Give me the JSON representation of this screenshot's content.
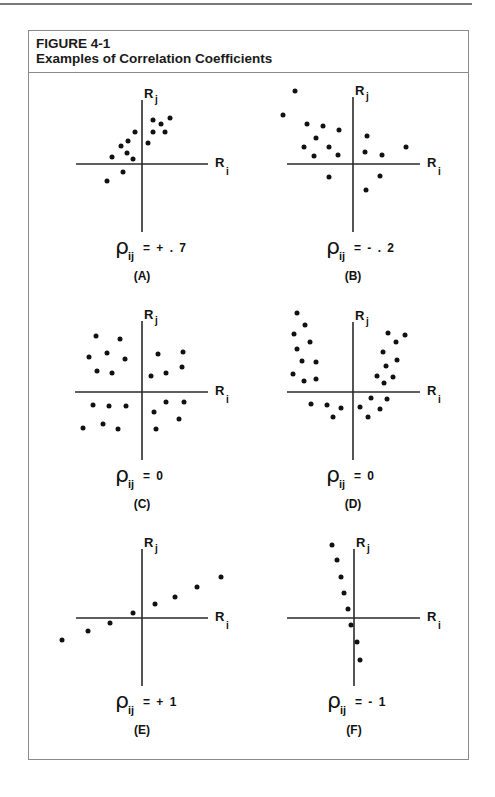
{
  "figure": {
    "number": "FIGURE 4-1",
    "title": "Examples of Correlation Coefficients"
  },
  "axis_labels": {
    "y_main": "R",
    "y_sub": "j",
    "x_main": "R",
    "x_sub": "i"
  },
  "chart_data": [
    {
      "type": "scatter",
      "panel": "(A)",
      "coefficient_label": "ρij = +.7",
      "rho_symbol": "ρ",
      "rho_sub": "ij",
      "rho_value": "= + . 7",
      "correlation": 0.7,
      "xlabel": "Ri",
      "ylabel": "Rj",
      "origin": [
        142,
        164
      ],
      "axis_extent": {
        "x": [
          76,
          208
        ],
        "y": [
          100,
          232
        ]
      },
      "points_px": [
        [
          170,
          118
        ],
        [
          153,
          120
        ],
        [
          161,
          124
        ],
        [
          135,
          132
        ],
        [
          153,
          132
        ],
        [
          165,
          132
        ],
        [
          128,
          141
        ],
        [
          148,
          143
        ],
        [
          121,
          146
        ],
        [
          127,
          153
        ],
        [
          112,
          157
        ],
        [
          133,
          159
        ],
        [
          123,
          172
        ],
        [
          107,
          181
        ]
      ]
    },
    {
      "type": "scatter",
      "panel": "(B)",
      "coefficient_label": "ρij = -.2",
      "rho_symbol": "ρ",
      "rho_sub": "ij",
      "rho_value": "= - . 2",
      "correlation": -0.2,
      "xlabel": "Ri",
      "ylabel": "Rj",
      "origin": [
        353,
        164
      ],
      "axis_extent": {
        "x": [
          287,
          420
        ],
        "y": [
          97,
          232
        ]
      },
      "points_px": [
        [
          295,
          91
        ],
        [
          283,
          115
        ],
        [
          307,
          124
        ],
        [
          323,
          126
        ],
        [
          339,
          130
        ],
        [
          316,
          138
        ],
        [
          367,
          136
        ],
        [
          304,
          147
        ],
        [
          329,
          147
        ],
        [
          406,
          147
        ],
        [
          365,
          152
        ],
        [
          338,
          155
        ],
        [
          382,
          155
        ],
        [
          314,
          156
        ],
        [
          329,
          177
        ],
        [
          380,
          176
        ],
        [
          366,
          190
        ]
      ]
    },
    {
      "type": "scatter",
      "panel": "(C)",
      "coefficient_label": "ρij = 0",
      "rho_symbol": "ρ",
      "rho_sub": "ij",
      "rho_value": "= 0",
      "correlation": 0,
      "xlabel": "Ri",
      "ylabel": "Rj",
      "origin": [
        142,
        392
      ],
      "axis_extent": {
        "x": [
          75,
          208
        ],
        "y": [
          321,
          460
        ]
      },
      "points_px": [
        [
          96,
          336
        ],
        [
          120,
          339
        ],
        [
          89,
          357
        ],
        [
          107,
          353
        ],
        [
          125,
          359
        ],
        [
          158,
          354
        ],
        [
          183,
          352
        ],
        [
          97,
          371
        ],
        [
          112,
          373
        ],
        [
          151,
          376
        ],
        [
          166,
          373
        ],
        [
          182,
          367
        ],
        [
          93,
          405
        ],
        [
          109,
          406
        ],
        [
          126,
          406
        ],
        [
          166,
          402
        ],
        [
          184,
          402
        ],
        [
          154,
          412
        ],
        [
          179,
          419
        ],
        [
          83,
          428
        ],
        [
          103,
          424
        ],
        [
          118,
          429
        ],
        [
          156,
          429
        ]
      ]
    },
    {
      "type": "scatter",
      "panel": "(D)",
      "coefficient_label": "ρij = 0",
      "rho_symbol": "ρ",
      "rho_sub": "ij",
      "rho_value": "= 0",
      "correlation": 0,
      "xlabel": "Ri",
      "ylabel": "Rj",
      "origin": [
        353,
        392
      ],
      "axis_extent": {
        "x": [
          287,
          420
        ],
        "y": [
          322,
          460
        ]
      },
      "points_px": [
        [
          297,
          313
        ],
        [
          305,
          325
        ],
        [
          294,
          334
        ],
        [
          310,
          342
        ],
        [
          297,
          349
        ],
        [
          302,
          361
        ],
        [
          316,
          362
        ],
        [
          293,
          374
        ],
        [
          304,
          381
        ],
        [
          316,
          379
        ],
        [
          388,
          333
        ],
        [
          405,
          335
        ],
        [
          396,
          342
        ],
        [
          383,
          352
        ],
        [
          397,
          360
        ],
        [
          386,
          366
        ],
        [
          377,
          376
        ],
        [
          393,
          377
        ],
        [
          384,
          383
        ],
        [
          311,
          404
        ],
        [
          327,
          405
        ],
        [
          341,
          408
        ],
        [
          333,
          417
        ],
        [
          371,
          398
        ],
        [
          387,
          399
        ],
        [
          360,
          407
        ],
        [
          380,
          409
        ],
        [
          368,
          417
        ]
      ]
    },
    {
      "type": "scatter",
      "panel": "(E)",
      "coefficient_label": "ρij = +1",
      "rho_symbol": "ρ",
      "rho_sub": "ij",
      "rho_value": "= + 1",
      "correlation": 1,
      "xlabel": "Ri",
      "ylabel": "Rj",
      "origin": [
        142,
        618
      ],
      "axis_extent": {
        "x": [
          76,
          208
        ],
        "y": [
          549,
          686
        ]
      },
      "points_px": [
        [
          62,
          640
        ],
        [
          88,
          631
        ],
        [
          110,
          623
        ],
        [
          133,
          613
        ],
        [
          155,
          604
        ],
        [
          175,
          597
        ],
        [
          197,
          587
        ],
        [
          221,
          577
        ]
      ]
    },
    {
      "type": "scatter",
      "panel": "(F)",
      "coefficient_label": "ρij = -1",
      "rho_symbol": "ρ",
      "rho_sub": "ij",
      "rho_value": "= - 1",
      "correlation": -1,
      "xlabel": "Ri",
      "ylabel": "Rj",
      "origin": [
        354,
        618
      ],
      "axis_extent": {
        "x": [
          287,
          420
        ],
        "y": [
          549,
          686
        ]
      },
      "points_px": [
        [
          332,
          545
        ],
        [
          337,
          560
        ],
        [
          341,
          577
        ],
        [
          344,
          593
        ],
        [
          348,
          609
        ],
        [
          351,
          625
        ],
        [
          357,
          642
        ],
        [
          360,
          660
        ]
      ]
    }
  ]
}
